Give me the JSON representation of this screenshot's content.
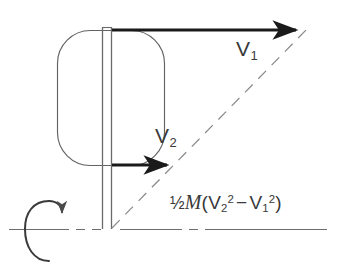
{
  "figure": {
    "background_color": "#ffffff",
    "line_color": "#4a4a4a",
    "vector_color": "#1a1a1a",
    "text_color": "#3a3a3a",
    "labels": {
      "v1": "V",
      "v1_sub": "1",
      "v2": "V",
      "v2_sub": "2"
    },
    "formula": {
      "fraction": "½",
      "mass_symbol": "M",
      "open_paren": "(",
      "term1_base": "V",
      "term1_sub": "2",
      "term1_sup": "2",
      "operator": "−",
      "term2_base": "V",
      "term2_sub": "1",
      "term2_sup": "2",
      "close_paren": ")",
      "plain_text": "½M(V₂² − V₁²)"
    },
    "elements": {
      "blade_name": "blade-body",
      "shaft_name": "rotation-shaft",
      "v1_arrow_name": "velocity-vector-v1",
      "v2_arrow_name": "velocity-vector-v2",
      "diagonal_name": "resultant-dashed-line",
      "axis_name": "rotation-axis-centerline",
      "spin_name": "rotation-direction-arrow"
    }
  }
}
